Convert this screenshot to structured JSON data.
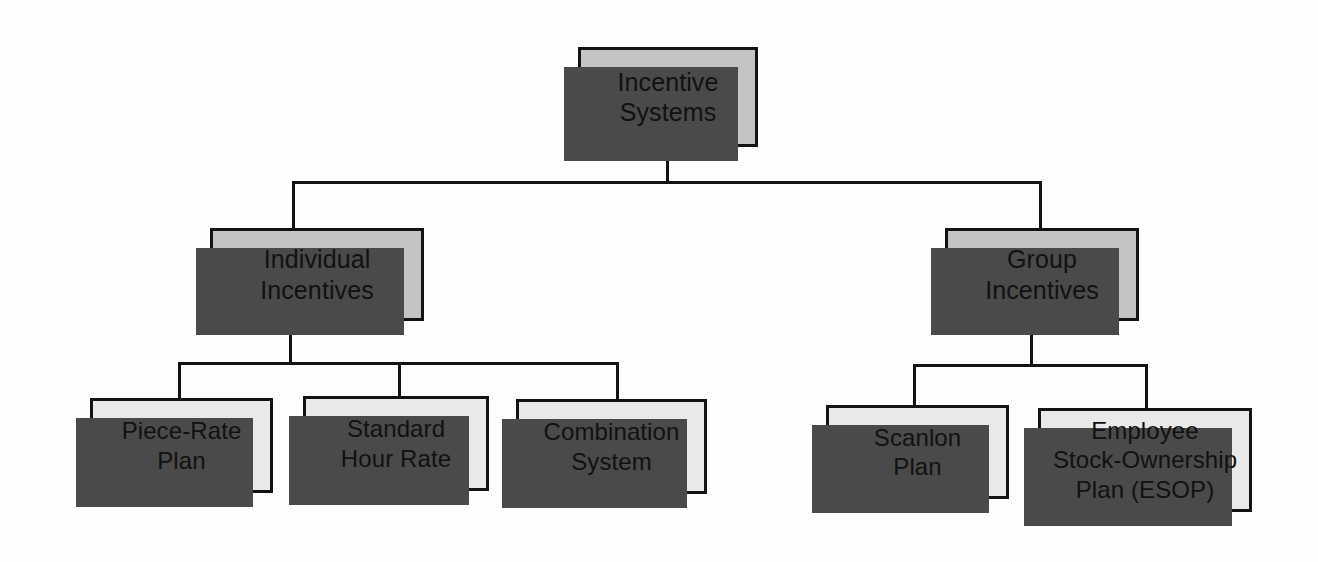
{
  "diagram": {
    "type": "organizational-hierarchy-chart",
    "background_color": "#fdfdfd",
    "line_color": "#131313",
    "shadow_color": "#4a4a4a",
    "branch_fill_color": "#c4c4c4",
    "leaf_fill_color": "#e9e9e9"
  },
  "nodes": {
    "root": {
      "label": "Incentive Systems",
      "line1": "Incentive",
      "line2": "Systems"
    },
    "branch_left": {
      "label": "Individual Incentives",
      "line1": "Individual",
      "line2": "Incentives"
    },
    "branch_right": {
      "label": "Group Incentives",
      "line1": "Group",
      "line2": "Incentives"
    },
    "leaf_piece_rate": {
      "label": "Piece-Rate Plan",
      "line1": "Piece-Rate",
      "line2": "Plan"
    },
    "leaf_standard_hour": {
      "label": "Standard Hour Rate",
      "line1": "Standard",
      "line2": "Hour Rate"
    },
    "leaf_combination": {
      "label": "Combination System",
      "line1": "Combination",
      "line2": "System"
    },
    "leaf_scanlon": {
      "label": "Scanlon Plan",
      "line1": "Scanlon",
      "line2": "Plan"
    },
    "leaf_esop": {
      "label": "Employee Stock-Ownership Plan (ESOP)",
      "line1": "Employee",
      "line2": "Stock-Ownership",
      "line3": "Plan (ESOP)"
    }
  }
}
